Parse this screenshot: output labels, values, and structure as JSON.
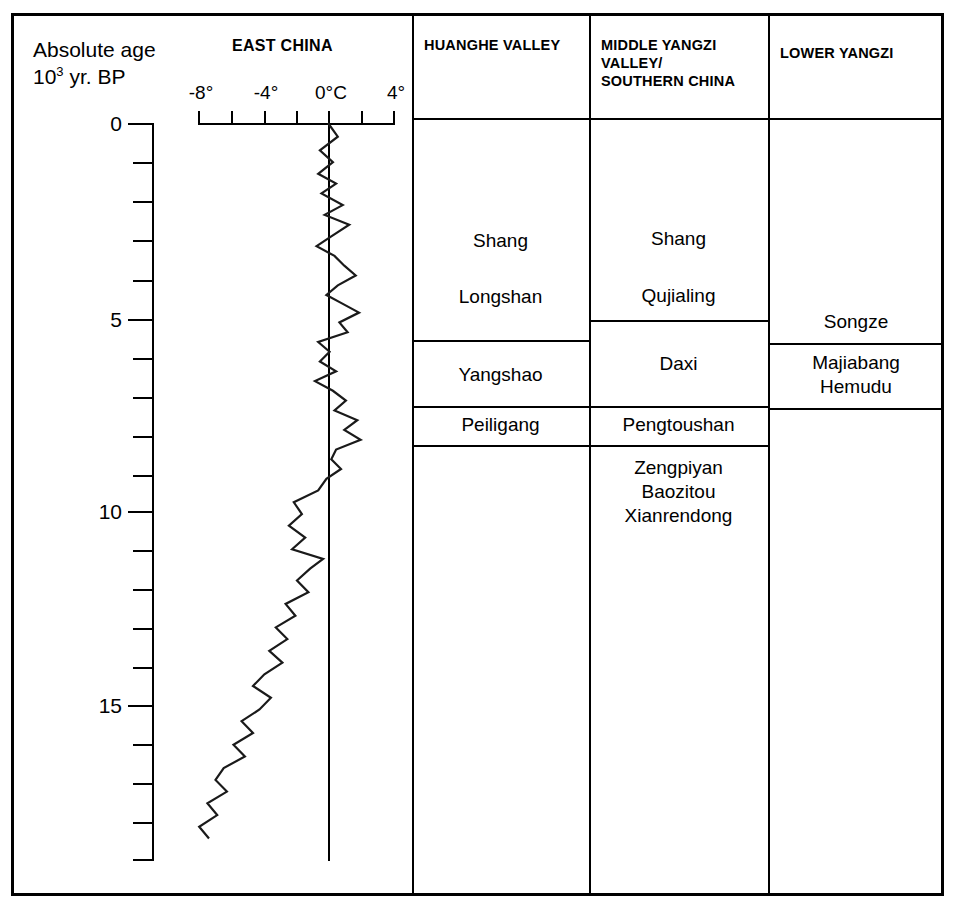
{
  "figure": {
    "left_header": {
      "line1": "Absolute age",
      "line2_prefix": "10",
      "line2_sup": "3",
      "line2_suffix": " yr. BP"
    },
    "panel_title": "EAST CHINA",
    "columns": [
      {
        "id": "huanghe",
        "label": "HUANGHE VALLEY"
      },
      {
        "id": "middle-yangzi",
        "label": "MIDDLE YANGZI\nVALLEY/\nSOUTHERN CHINA"
      },
      {
        "id": "lower-yangzi",
        "label": "LOWER YANGZI"
      }
    ],
    "cultures": {
      "huanghe": [
        {
          "name": "Shang"
        },
        {
          "name": "Longshan"
        },
        {
          "name": "Yangshao"
        },
        {
          "name": "Peiligang"
        }
      ],
      "middle_yangzi": [
        {
          "name": "Shang"
        },
        {
          "name": "Qujialing"
        },
        {
          "name": "Daxi"
        },
        {
          "name": "Pengtoushan"
        },
        {
          "name": "Zengpiyan\nBaozitou\nXianrendong"
        }
      ],
      "lower_yangzi": [
        {
          "name": "Songze"
        },
        {
          "name": "Majiabang\nHemudu"
        }
      ]
    }
  },
  "chart_data": {
    "type": "line",
    "title": "EAST CHINA",
    "orientation": "vertical",
    "xlabel": "Temperature (°C, deviation)",
    "ylabel": "Absolute age 10³ yr. BP",
    "xlim": [
      -10,
      4
    ],
    "ylim": [
      0,
      19
    ],
    "y_inverted": true,
    "grid": false,
    "legend": null,
    "x_ticks": [
      -8,
      -7,
      -6,
      -5,
      -4,
      -3,
      -2,
      -1,
      0,
      1,
      2,
      3,
      4
    ],
    "x_tick_labels": [
      "-8°",
      "",
      "-4°",
      "",
      "0°C",
      "",
      "4°"
    ],
    "x_labeled_ticks": [
      -8,
      -4,
      0,
      4
    ],
    "y_ticks": [
      0,
      1,
      2,
      3,
      4,
      5,
      6,
      7,
      8,
      9,
      10,
      11,
      12,
      13,
      14,
      15,
      16,
      17,
      18,
      19
    ],
    "y_labeled_ticks": [
      0,
      5,
      10,
      15
    ],
    "y_tick_labels": [
      "0",
      "5",
      "10",
      "15"
    ],
    "zero_reference_line": 0,
    "series": [
      {
        "name": "East China temperature anomaly",
        "age_kyr_BP": [
          0.0,
          0.35,
          0.7,
          1.0,
          1.3,
          1.55,
          1.8,
          2.1,
          2.35,
          2.6,
          2.9,
          3.15,
          3.4,
          3.65,
          3.9,
          4.15,
          4.4,
          4.6,
          4.85,
          5.1,
          5.35,
          5.6,
          5.85,
          6.1,
          6.35,
          6.6,
          6.85,
          7.1,
          7.35,
          7.6,
          7.85,
          8.1,
          8.35,
          8.6,
          8.85,
          9.1,
          9.4,
          9.7,
          10.0,
          10.3,
          10.6,
          10.9,
          11.15,
          11.4,
          11.7,
          12.0,
          12.3,
          12.6,
          12.9,
          13.2,
          13.5,
          13.8,
          14.1,
          14.4,
          14.7,
          15.0,
          15.3,
          15.6,
          15.9,
          16.2,
          16.5,
          16.8,
          17.1,
          17.4,
          17.7,
          18.0,
          18.3
        ],
        "temperature_C": [
          0.0,
          0.6,
          -0.5,
          0.3,
          -0.6,
          0.5,
          -0.4,
          0.9,
          -0.2,
          1.3,
          0.2,
          -0.7,
          0.4,
          1.0,
          1.7,
          0.6,
          -0.1,
          0.8,
          1.9,
          0.7,
          1.2,
          -0.6,
          0.1,
          -0.5,
          0.5,
          -0.8,
          0.3,
          1.1,
          0.4,
          1.8,
          1.0,
          2.0,
          0.5,
          0.2,
          0.8,
          -0.1,
          -0.6,
          -2.1,
          -1.6,
          -2.4,
          -1.4,
          -2.2,
          -0.3,
          -1.1,
          -1.9,
          -1.2,
          -2.6,
          -2.0,
          -3.2,
          -2.5,
          -3.6,
          -2.8,
          -3.9,
          -4.6,
          -3.5,
          -4.2,
          -5.3,
          -4.6,
          -5.8,
          -5.1,
          -6.4,
          -6.9,
          -6.2,
          -7.4,
          -6.8,
          -7.9,
          -7.3
        ]
      }
    ]
  }
}
